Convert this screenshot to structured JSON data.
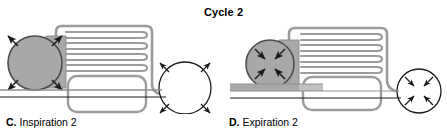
{
  "figure": {
    "title": "Cycle 2",
    "width": 447,
    "height": 136,
    "background": "#ffffff"
  },
  "colors": {
    "stroke": "#1a1a1a",
    "filled_gray": "#a8a8a8",
    "light_gray": "#b5b5b5",
    "white": "#ffffff",
    "text": "#000000"
  },
  "panels": [
    {
      "id": "panel-c",
      "letter": "C.",
      "caption": "Inspiration 2",
      "state": "inspiration",
      "parts": {
        "left_sphere": {
          "name": "chest-wall-sphere",
          "fill": "filled",
          "arrow_direction": "outward",
          "arrow_count": 4
        },
        "right_sphere": {
          "name": "abdomen-sphere",
          "fill": "empty",
          "arrow_direction": "outward",
          "arrow_count": 4
        },
        "airway_tubes": {
          "name": "airway-tubes",
          "count": 4
        },
        "air_sac": {
          "name": "air-sac",
          "fill": "empty"
        },
        "diaphragm": {
          "name": "diaphragm-baseline",
          "thickness": "thin",
          "state": "flat"
        }
      }
    },
    {
      "id": "panel-d",
      "letter": "D.",
      "caption": "Expiration 2",
      "state": "expiration",
      "parts": {
        "left_sphere": {
          "name": "chest-wall-sphere",
          "fill": "filled",
          "arrow_direction": "inward",
          "arrow_count": 4
        },
        "right_sphere": {
          "name": "abdomen-sphere",
          "fill": "empty",
          "arrow_direction": "inward",
          "arrow_count": 4
        },
        "airway_tubes": {
          "name": "airway-tubes",
          "count": 4
        },
        "air_sac": {
          "name": "air-sac",
          "fill": "empty"
        },
        "diaphragm": {
          "name": "diaphragm-baseline",
          "thickness": "thick",
          "state": "raised"
        }
      }
    }
  ]
}
